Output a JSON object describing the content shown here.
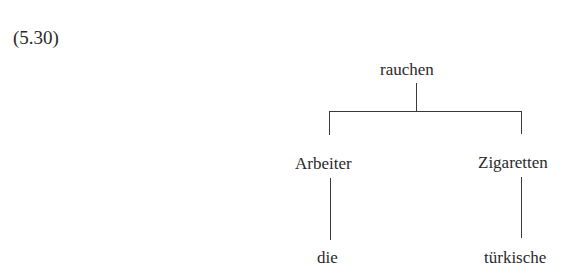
{
  "example_number": "(5.30)",
  "tree": {
    "root": {
      "label": "rauchen"
    },
    "children": [
      {
        "label": "Arbeiter",
        "children": [
          {
            "label": "die"
          }
        ]
      },
      {
        "label": "Zigaretten",
        "children": [
          {
            "label": "türkische"
          }
        ]
      }
    ]
  },
  "colors": {
    "text": "#2a2a2a",
    "lines": "#3a3a3a",
    "background": "#ffffff"
  }
}
